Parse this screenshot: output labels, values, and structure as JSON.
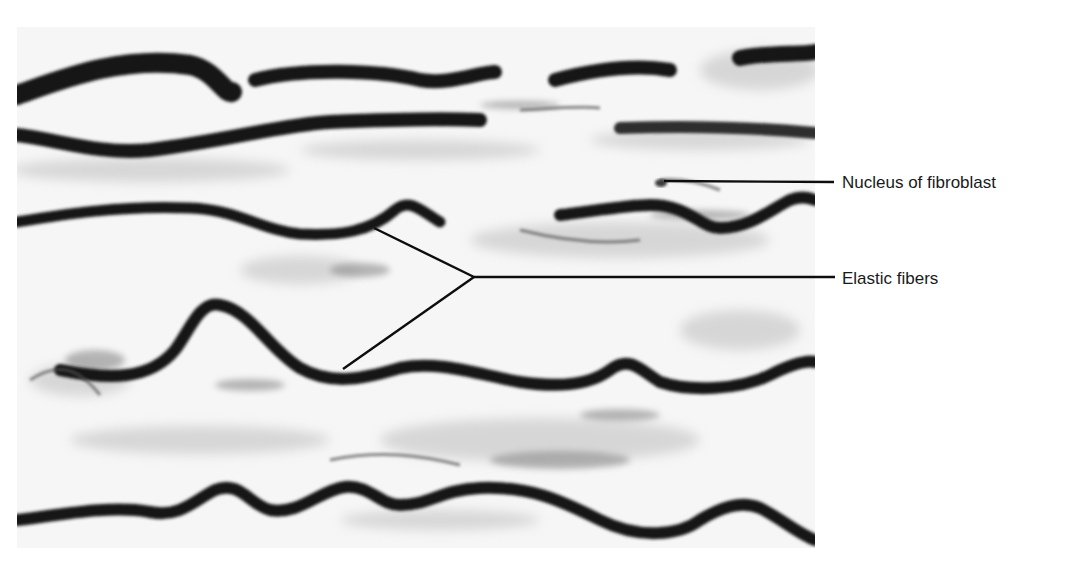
{
  "figure": {
    "micrograph": {
      "x": 17,
      "y": 27,
      "width": 798,
      "height": 521
    },
    "colors": {
      "background": "#ffffff",
      "fiber": "#141414",
      "tissue": "#bdbdbd",
      "leader": "#0d0d0d",
      "text": "#1a1a1a"
    }
  },
  "labels": [
    {
      "id": "nucleus",
      "text": "Nucleus of fibroblast",
      "leader_lines": [
        {
          "x1": 664,
          "y1": 181,
          "x2": 834,
          "y2": 182
        }
      ]
    },
    {
      "id": "elastic",
      "text": "Elastic fibers",
      "leader_lines": [
        {
          "x1": 374,
          "y1": 228,
          "x2": 474,
          "y2": 277
        },
        {
          "x1": 343,
          "y1": 369,
          "x2": 474,
          "y2": 277
        },
        {
          "x1": 474,
          "y1": 277,
          "x2": 835,
          "y2": 277
        }
      ]
    }
  ]
}
